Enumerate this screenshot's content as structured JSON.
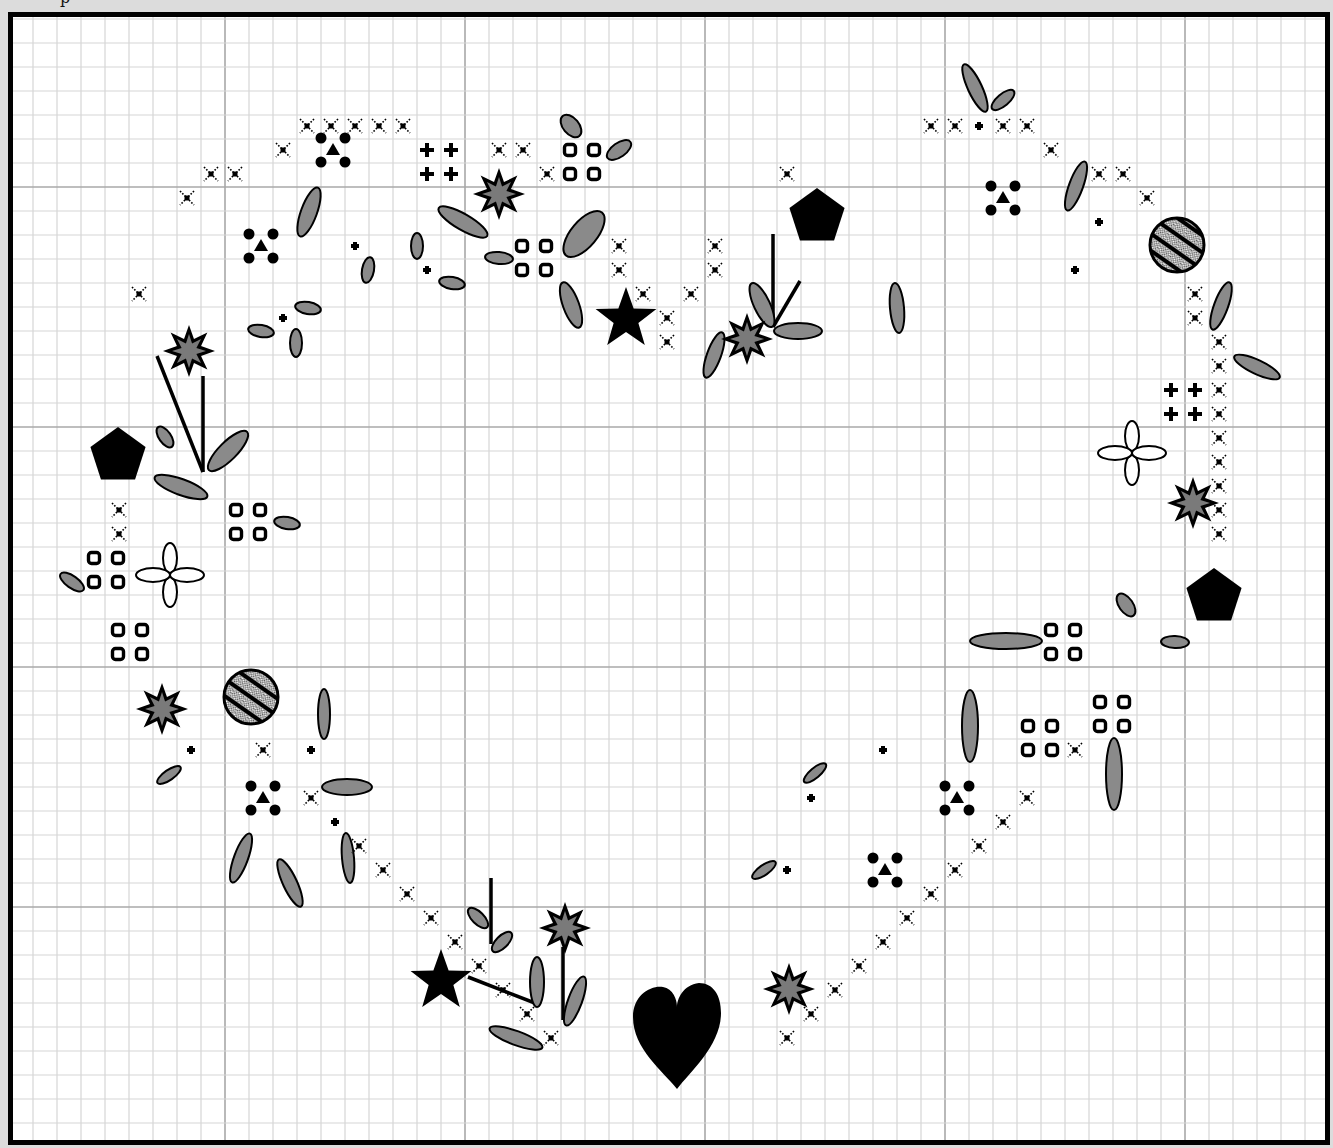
{
  "page": {
    "cropped_heading_glyph": "p",
    "background": "#dcdcdc"
  },
  "colors": {
    "grid_minor": "#d6d6d6",
    "grid_major": "#a8a8a8",
    "frame": "#000000",
    "symbol": "#000000",
    "leaf_fill": "#8a8a8a",
    "star_fill": "#7a7a7a",
    "paper": "#ffffff"
  },
  "grid": {
    "frame": {
      "x": 8,
      "y": 12,
      "w": 1322,
      "h": 1133,
      "stroke": 5
    },
    "cell": 24,
    "origin_x": -15,
    "origin_y": -53,
    "major_every": 10,
    "major_x": [
      225,
      465,
      705,
      945,
      1185
    ],
    "major_y": [
      187,
      426,
      666,
      906
    ]
  },
  "legend": {
    "cross": "full cross stitch (dotted X)",
    "plus": "cross stitch, alternate colour",
    "ring": "french knot / bead (rounded square)",
    "dot": "small bead",
    "cluster": "four beads with triangle centre",
    "leaf": "lazy daisy leaf (gray ellipse)",
    "burst": "8-point starburst flower",
    "star": "5-point star",
    "pentagon": "pentagon charm",
    "hatched": "hatched circle button",
    "outline_flower": "outlined four-petal flower",
    "heart": "heart charm",
    "line": "straight stitch"
  },
  "chart_data": {
    "type": "cross-stitch pattern",
    "title": "",
    "grid": {
      "cell_px": 24,
      "major_every": 10
    },
    "crosses": [
      [
        307,
        126
      ],
      [
        331,
        126
      ],
      [
        355,
        126
      ],
      [
        379,
        126
      ],
      [
        403,
        126
      ],
      [
        283,
        150
      ],
      [
        211,
        174
      ],
      [
        235,
        174
      ],
      [
        187,
        198
      ],
      [
        139,
        294
      ],
      [
        499,
        150
      ],
      [
        523,
        150
      ],
      [
        547,
        174
      ],
      [
        619,
        246
      ],
      [
        619,
        270
      ],
      [
        643,
        294
      ],
      [
        691,
        294
      ],
      [
        667,
        318
      ],
      [
        667,
        342
      ],
      [
        715,
        246
      ],
      [
        715,
        270
      ],
      [
        787,
        174
      ],
      [
        931,
        126
      ],
      [
        955,
        126
      ],
      [
        1003,
        126
      ],
      [
        1027,
        126
      ],
      [
        1051,
        150
      ],
      [
        1099,
        174
      ],
      [
        1123,
        174
      ],
      [
        1147,
        198
      ],
      [
        1195,
        294
      ],
      [
        1195,
        318
      ],
      [
        1219,
        342
      ],
      [
        1219,
        366
      ],
      [
        1219,
        390
      ],
      [
        1219,
        414
      ],
      [
        1219,
        438
      ],
      [
        1219,
        462
      ],
      [
        1219,
        486
      ],
      [
        1219,
        510
      ],
      [
        1219,
        534
      ],
      [
        119,
        510
      ],
      [
        119,
        534
      ],
      [
        263,
        750
      ],
      [
        311,
        798
      ],
      [
        359,
        846
      ],
      [
        383,
        870
      ],
      [
        407,
        894
      ],
      [
        431,
        918
      ],
      [
        455,
        942
      ],
      [
        479,
        966
      ],
      [
        503,
        990
      ],
      [
        527,
        1014
      ],
      [
        551,
        1038
      ],
      [
        1075,
        750
      ],
      [
        1027,
        798
      ],
      [
        1003,
        822
      ],
      [
        979,
        846
      ],
      [
        955,
        870
      ],
      [
        931,
        894
      ],
      [
        907,
        918
      ],
      [
        883,
        942
      ],
      [
        859,
        966
      ],
      [
        835,
        990
      ],
      [
        811,
        1014
      ],
      [
        787,
        1038
      ]
    ],
    "plus": [
      [
        427,
        150
      ],
      [
        451,
        150
      ],
      [
        427,
        174
      ],
      [
        451,
        174
      ],
      [
        1171,
        390
      ],
      [
        1195,
        390
      ],
      [
        1171,
        414
      ],
      [
        1195,
        414
      ]
    ],
    "rings": [
      [
        570,
        150
      ],
      [
        594,
        150
      ],
      [
        570,
        174
      ],
      [
        594,
        174
      ],
      [
        522,
        246
      ],
      [
        546,
        246
      ],
      [
        522,
        270
      ],
      [
        546,
        270
      ],
      [
        236,
        510
      ],
      [
        260,
        510
      ],
      [
        236,
        534
      ],
      [
        260,
        534
      ],
      [
        94,
        558
      ],
      [
        118,
        558
      ],
      [
        94,
        582
      ],
      [
        118,
        582
      ],
      [
        118,
        630
      ],
      [
        142,
        630
      ],
      [
        118,
        654
      ],
      [
        142,
        654
      ],
      [
        1051,
        630
      ],
      [
        1075,
        630
      ],
      [
        1051,
        654
      ],
      [
        1075,
        654
      ],
      [
        1100,
        702
      ],
      [
        1124,
        702
      ],
      [
        1100,
        726
      ],
      [
        1124,
        726
      ],
      [
        1028,
        726
      ],
      [
        1052,
        726
      ],
      [
        1028,
        750
      ],
      [
        1052,
        750
      ]
    ],
    "dots": [
      [
        355,
        246
      ],
      [
        427,
        270
      ],
      [
        283,
        318
      ],
      [
        979,
        126
      ],
      [
        1099,
        222
      ],
      [
        1075,
        270
      ],
      [
        191,
        750
      ],
      [
        311,
        750
      ],
      [
        335,
        822
      ],
      [
        883,
        750
      ],
      [
        811,
        798
      ],
      [
        787,
        870
      ]
    ],
    "clusters": [
      [
        333,
        150
      ],
      [
        261,
        246
      ],
      [
        1003,
        198
      ],
      [
        263,
        798
      ],
      [
        957,
        798
      ],
      [
        885,
        870
      ]
    ],
    "leaves": [
      [
        571,
        126,
        8,
        13,
        -40
      ],
      [
        619,
        150,
        7,
        14,
        55
      ],
      [
        309,
        212,
        8,
        26,
        20
      ],
      [
        463,
        222,
        8,
        28,
        -60
      ],
      [
        584,
        234,
        13,
        28,
        40
      ],
      [
        499,
        258,
        6,
        14,
        -85
      ],
      [
        417,
        246,
        6,
        13,
        0
      ],
      [
        368,
        270,
        6,
        13,
        10
      ],
      [
        452,
        283,
        6,
        13,
        -80
      ],
      [
        571,
        305,
        8,
        24,
        -20
      ],
      [
        308,
        308,
        6,
        13,
        -80
      ],
      [
        261,
        331,
        6,
        13,
        -80
      ],
      [
        296,
        343,
        6,
        14,
        0
      ],
      [
        975,
        88,
        7,
        26,
        -25
      ],
      [
        1003,
        100,
        6,
        14,
        50
      ],
      [
        1076,
        186,
        7,
        26,
        20
      ],
      [
        1221,
        306,
        7,
        25,
        20
      ],
      [
        1257,
        367,
        7,
        25,
        -65
      ],
      [
        897,
        308,
        7,
        25,
        -5
      ],
      [
        762,
        305,
        8,
        24,
        -25
      ],
      [
        798,
        331,
        8,
        24,
        -90
      ],
      [
        714,
        355,
        7,
        24,
        20
      ],
      [
        165,
        437,
        6,
        12,
        -35
      ],
      [
        228,
        451,
        9,
        27,
        45
      ],
      [
        181,
        487,
        8,
        28,
        -70
      ],
      [
        287,
        523,
        6,
        13,
        -80
      ],
      [
        72,
        582,
        6,
        14,
        -55
      ],
      [
        1126,
        605,
        7,
        13,
        -35
      ],
      [
        1006,
        641,
        8,
        36,
        -90
      ],
      [
        1175,
        642,
        6,
        14,
        -88
      ],
      [
        970,
        726,
        8,
        36,
        0
      ],
      [
        1114,
        774,
        8,
        36,
        0
      ],
      [
        815,
        773,
        5,
        14,
        50
      ],
      [
        764,
        870,
        5,
        14,
        55
      ],
      [
        324,
        714,
        6,
        25,
        0
      ],
      [
        347,
        787,
        8,
        25,
        -90
      ],
      [
        169,
        775,
        5,
        14,
        55
      ],
      [
        241,
        858,
        7,
        26,
        20
      ],
      [
        290,
        883,
        7,
        26,
        -25
      ],
      [
        348,
        858,
        6,
        25,
        -5
      ],
      [
        478,
        918,
        6,
        13,
        -45
      ],
      [
        502,
        942,
        6,
        13,
        45
      ],
      [
        537,
        982,
        7,
        25,
        0
      ],
      [
        575,
        1001,
        7,
        26,
        20
      ],
      [
        516,
        1038,
        7,
        28,
        -70
      ]
    ],
    "bursts": [
      [
        499,
        194
      ],
      [
        189,
        351
      ],
      [
        747,
        339
      ],
      [
        1193,
        503
      ],
      [
        162,
        709
      ],
      [
        565,
        928
      ],
      [
        789,
        989
      ]
    ],
    "stars": [
      [
        626,
        319
      ],
      [
        441,
        981
      ]
    ],
    "pentagons": [
      [
        817,
        217
      ],
      [
        118,
        456
      ],
      [
        1214,
        597
      ]
    ],
    "hatched": [
      [
        1177,
        245
      ],
      [
        251,
        697
      ]
    ],
    "outline_flowers": [
      [
        1132,
        453
      ],
      [
        170,
        575
      ]
    ],
    "hearts": [
      [
        677,
        1035
      ]
    ],
    "lines": [
      [
        773,
        234,
        773,
        327
      ],
      [
        800,
        281,
        773,
        327
      ],
      [
        157,
        356,
        203,
        472
      ],
      [
        203,
        376,
        203,
        472
      ],
      [
        491,
        878,
        491,
        944
      ],
      [
        468,
        977,
        540,
        1005
      ],
      [
        563,
        947,
        563,
        1020
      ]
    ]
  }
}
